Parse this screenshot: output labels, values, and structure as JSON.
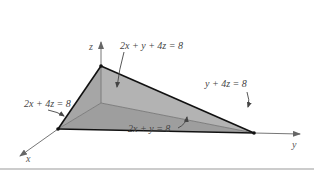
{
  "diagram": {
    "axes": {
      "z": "z",
      "y": "y",
      "x": "x"
    },
    "labels": {
      "top_face": "2x + y + 4z = 8",
      "right_edge": "y + 4z = 8",
      "left_edge": "2x + 4z = 8",
      "bottom_edge": "2x + y = 8"
    },
    "colors": {
      "face_fill": "#a9a9a9",
      "edge": "#111111",
      "axis": "#666666",
      "divider": "#9a9a9a"
    }
  }
}
